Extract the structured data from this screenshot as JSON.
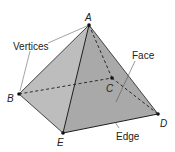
{
  "diagram": {
    "type": "square-pyramid",
    "colors": {
      "left_face": "#bdbdbd",
      "front_face": "#a9a9a9",
      "edge": "#1e1e1e",
      "leader": "#555555",
      "background": "#ffffff"
    },
    "vertices": {
      "A": {
        "label": "A",
        "x": 89,
        "y": 25
      },
      "B": {
        "label": "B",
        "x": 19,
        "y": 94
      },
      "C": {
        "label": "C",
        "x": 112,
        "y": 78
      },
      "D": {
        "label": "D",
        "x": 158,
        "y": 114
      },
      "E": {
        "label": "E",
        "x": 63,
        "y": 133
      }
    },
    "callouts": {
      "vertices": "Vertices",
      "face": "Face",
      "edge": "Edge"
    }
  }
}
